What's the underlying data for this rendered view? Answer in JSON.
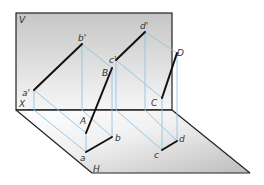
{
  "diagram": {
    "type": "orthographic-projection",
    "planes": {
      "vertical": {
        "label": "V"
      },
      "horizontal": {
        "label": "H"
      },
      "axis": {
        "label": "X"
      }
    },
    "points": {
      "a_prime": "a'",
      "b_prime": "b'",
      "c_prime": "c'",
      "d_prime": "d'",
      "A": "A",
      "B": "B",
      "C": "C",
      "D": "D",
      "a": "a",
      "b": "b",
      "c": "c",
      "d": "d"
    },
    "colors": {
      "plane_edge": "#222222",
      "segment": "#111111",
      "projector": "#8ec3e6",
      "v_plane_fill_top": "#c9c9c9",
      "v_plane_fill_bottom": "#f4f4f4",
      "h_plane_fill_left": "#ffffff",
      "h_plane_fill_right": "#c4c4c4"
    }
  }
}
